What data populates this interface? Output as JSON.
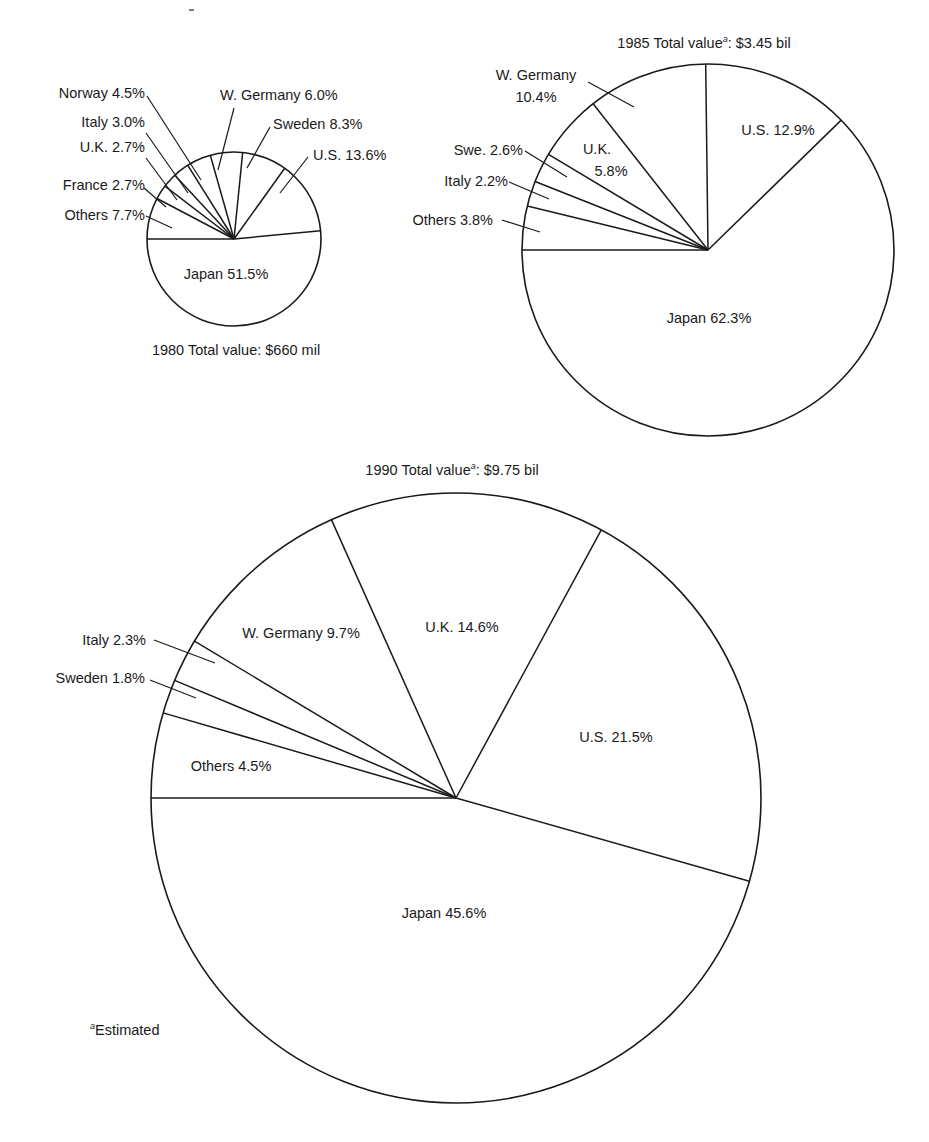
{
  "chart_data": [
    {
      "type": "pie",
      "title": "1980 Total value: $660 mil",
      "title_parts": {
        "year": "1980",
        "label": "Total value",
        "footnote_mark": "",
        "value": "$660 mil"
      },
      "categories": [
        "Others",
        "France",
        "U.K.",
        "Italy",
        "Norway",
        "W. Germany",
        "Sweden",
        "U.S.",
        "Japan"
      ],
      "values": [
        7.7,
        2.7,
        2.7,
        3.0,
        4.5,
        6.0,
        8.3,
        13.6,
        51.5
      ],
      "unit": "%",
      "start": "left horizontal, clockwise",
      "labels": [
        {
          "text": "Others 7.7%",
          "x": 145,
          "y": 220,
          "anchor": "end",
          "leader": [
            146,
            216,
            172,
            228
          ]
        },
        {
          "text": "France 2.7%",
          "x": 145,
          "y": 190,
          "anchor": "end",
          "leader": [
            144,
            188,
            166,
            207
          ]
        },
        {
          "text": "U.K. 2.7%",
          "x": 145,
          "y": 152,
          "anchor": "end",
          "leader": [
            146,
            158,
            177,
            200
          ]
        },
        {
          "text": "Italy 3.0%",
          "x": 145,
          "y": 127,
          "anchor": "end",
          "leader": [
            146,
            133,
            188,
            193
          ]
        },
        {
          "text": "Norway 4.5%",
          "x": 145,
          "y": 98,
          "anchor": "end",
          "leader": [
            147,
            96,
            201,
            180
          ]
        },
        {
          "text": "W. Germany 6.0%",
          "x": 220,
          "y": 100,
          "anchor": "start",
          "leader": [
            234,
            108,
            218,
            170
          ]
        },
        {
          "text": "Sweden 8.3%",
          "x": 273,
          "y": 129,
          "anchor": "start",
          "leader": [
            270,
            127,
            247,
            168
          ]
        },
        {
          "text": "U.S. 13.6%",
          "x": 313,
          "y": 160,
          "anchor": "start",
          "leader": [
            308,
            157,
            280,
            193
          ]
        },
        {
          "text": "Japan 51.5%",
          "x": 226,
          "y": 279,
          "anchor": "middle",
          "leader": null
        }
      ],
      "geometry": {
        "cx": 234,
        "cy": 239,
        "r": 87
      },
      "title_pos": {
        "x": 236,
        "y": 355
      }
    },
    {
      "type": "pie",
      "title": "1985 Total value^a: $3.45 bil",
      "title_parts": {
        "year": "1985",
        "label": "Total value",
        "footnote_mark": "a",
        "value": "$3.45 bil"
      },
      "categories": [
        "Others",
        "Italy",
        "Swe.",
        "U.K.",
        "W. Germany",
        "U.S.",
        "Japan"
      ],
      "values": [
        3.8,
        2.2,
        2.6,
        5.8,
        10.4,
        12.9,
        62.3
      ],
      "unit": "%",
      "start": "left horizontal, clockwise",
      "labels": [
        {
          "text": "Others 3.8%",
          "x": 493,
          "y": 225,
          "anchor": "end",
          "leader": [
            502,
            220,
            540,
            232
          ]
        },
        {
          "text": "Italy 2.2%",
          "x": 508,
          "y": 186,
          "anchor": "end",
          "leader": [
            509,
            182,
            549,
            199
          ]
        },
        {
          "text": "Swe. 2.6%",
          "x": 523,
          "y": 155,
          "anchor": "end",
          "leader": [
            525,
            151,
            567,
            177
          ]
        },
        {
          "text": "U.K.",
          "x": 597,
          "y": 154,
          "anchor": "middle",
          "leader": null
        },
        {
          "text": "5.8%",
          "x": 611,
          "y": 176,
          "anchor": "middle",
          "leader": null
        },
        {
          "text": "W. Germany",
          "x": 536,
          "y": 80,
          "anchor": "middle",
          "leader": [
            588,
            82,
            634,
            107
          ]
        },
        {
          "text": "10.4%",
          "x": 536,
          "y": 102,
          "anchor": "middle",
          "leader": null
        },
        {
          "text": "U.S. 12.9%",
          "x": 778,
          "y": 135,
          "anchor": "middle",
          "leader": null
        },
        {
          "text": "Japan 62.3%",
          "x": 709,
          "y": 323,
          "anchor": "middle",
          "leader": null
        }
      ],
      "geometry": {
        "cx": 708,
        "cy": 250,
        "r": 186
      },
      "title_pos": {
        "x": 704,
        "y": 48
      }
    },
    {
      "type": "pie",
      "title": "1990 Total value^a: $9.75 bil",
      "title_parts": {
        "year": "1990",
        "label": "Total value",
        "footnote_mark": "a",
        "value": "$9.75 bil"
      },
      "categories": [
        "Others",
        "Sweden",
        "Italy",
        "W. Germany",
        "U.K.",
        "U.S.",
        "Japan"
      ],
      "values": [
        4.5,
        1.8,
        2.3,
        9.7,
        14.6,
        21.5,
        45.6
      ],
      "unit": "%",
      "start": "left horizontal, clockwise",
      "labels": [
        {
          "text": "Others 4.5%",
          "x": 231,
          "y": 771,
          "anchor": "middle",
          "leader": null
        },
        {
          "text": "Sweden 1.8%",
          "x": 145,
          "y": 683,
          "anchor": "end",
          "leader": [
            150,
            680,
            196,
            698
          ]
        },
        {
          "text": "Italy 2.3%",
          "x": 146,
          "y": 645,
          "anchor": "end",
          "leader": [
            154,
            640,
            215,
            663
          ]
        },
        {
          "text": "W. Germany 9.7%",
          "x": 301,
          "y": 638,
          "anchor": "middle",
          "leader": null
        },
        {
          "text": "U.K. 14.6%",
          "x": 462,
          "y": 632,
          "anchor": "middle",
          "leader": null
        },
        {
          "text": "U.S. 21.5%",
          "x": 616,
          "y": 742,
          "anchor": "middle",
          "leader": null
        },
        {
          "text": "Japan 45.6%",
          "x": 444,
          "y": 918,
          "anchor": "middle",
          "leader": null
        }
      ],
      "geometry": {
        "cx": 456,
        "cy": 798,
        "r": 305
      },
      "title_pos": {
        "x": 452,
        "y": 475
      }
    }
  ],
  "footnote": {
    "mark": "a",
    "text": "Estimated",
    "x": 90,
    "y": 1035
  }
}
